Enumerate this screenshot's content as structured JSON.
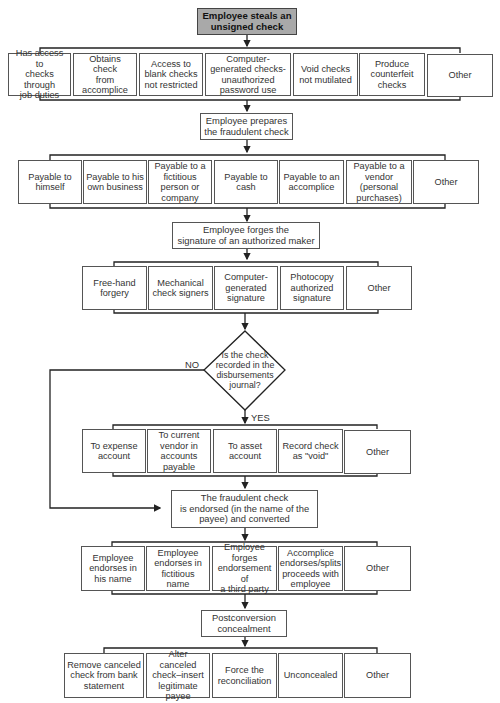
{
  "diagram": {
    "start": "Employee steals an\nunsigned check",
    "theft_methods": [
      "Has access to\nchecks through\njob duties",
      "Obtains check\nfrom\naccomplice",
      "Access to\nblank checks\nnot restricted",
      "Computer-\ngenerated checks-\nunauthorized\npassword use",
      "Void checks\nnot mutilated",
      "Produce\ncounterfeit\nchecks",
      "Other"
    ],
    "prepare_step": "Employee prepares\nthe fraudulent check",
    "payees": [
      "Payable to\nhimself",
      "Payable to his\nown business",
      "Payable to a\nfictitious\nperson or\ncompany",
      "Payable to\ncash",
      "Payable to an\naccomplice",
      "Payable to a\nvendor\n(personal\npurchases)",
      "Other"
    ],
    "forge_step": "Employee forges the\nsignature of an authorized maker",
    "forgery_methods": [
      "Free-hand\nforgery",
      "Mechanical\ncheck signers",
      "Computer-\ngenerated\nsignature",
      "Photocopy\nauthorized\nsignature",
      "Other"
    ],
    "decision": "Is the check\nrecorded in the\ndisbursements\njournal?",
    "decision_no": "NO",
    "decision_yes": "YES",
    "recording_methods": [
      "To expense\naccount",
      "To current\nvendor in\naccounts\npayable",
      "To asset\naccount",
      "Record check\nas \"void\"",
      "Other"
    ],
    "endorse_step": "The fraudulent check\nis endorsed (in the name of the\npayee) and converted",
    "endorsement_methods": [
      "Employee\nendorses in\nhis name",
      "Employee\nendorses in\nfictitious name",
      "Employee\nforges\nendorsement of\na third party",
      "Accomplice\nendorses/splits\nproceeds with\nemployee",
      "Other"
    ],
    "conceal_step": "Postconversion\nconcealment",
    "concealment_methods": [
      "Remove canceled\ncheck from bank\nstatement",
      "Alter canceled\ncheck–insert\nlegitimate\npayee",
      "Force the\nreconciliation",
      "Unconcealed",
      "Other"
    ],
    "colors": {
      "start_fill": "#a9a9a9",
      "line": "#222222",
      "box_border": "#555555"
    }
  }
}
